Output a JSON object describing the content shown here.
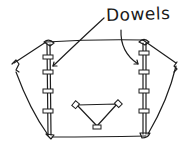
{
  "diagram": {
    "label": "Dowels",
    "ink_color": "#1e1e1e",
    "background": "#ffffff",
    "left_dowel": {
      "x": 48,
      "y_top": 44,
      "y_bottom": 135,
      "clamps_y": [
        57,
        72,
        91,
        111
      ]
    },
    "right_dowel": {
      "x": 144,
      "y_top": 43,
      "y_bottom": 134,
      "clamps_y": [
        53,
        72,
        91,
        111
      ]
    },
    "triangle": {
      "points": [
        [
          76,
          105
        ],
        [
          118,
          105
        ],
        [
          97,
          127
        ]
      ]
    },
    "arrows": [
      {
        "target": "left-dowel",
        "to": [
          52,
          67
        ]
      },
      {
        "target": "right-dowel",
        "to": [
          138,
          64
        ]
      }
    ]
  }
}
